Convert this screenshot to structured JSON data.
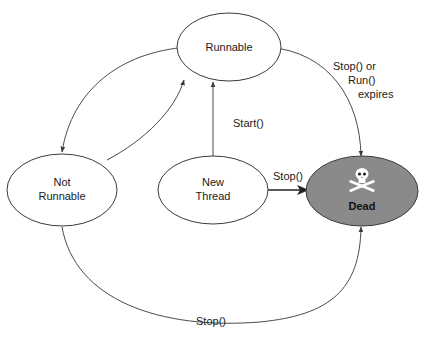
{
  "diagram": {
    "type": "state-diagram",
    "colors": {
      "background": "#ffffff",
      "node_fill": "#ffffff",
      "dead_fill": "#8a8a8a",
      "stroke": "#3a3a3a",
      "skull": "#ffffff"
    },
    "nodes": {
      "runnable": {
        "label": "Runnable"
      },
      "not_runnable": {
        "line1": "Not",
        "line2": "Runnable"
      },
      "new_thread": {
        "line1": "New",
        "line2": "Thread"
      },
      "dead": {
        "label": "Dead",
        "icon": "skull-crossbones-icon"
      }
    },
    "edges": {
      "runnable_to_not_runnable": {
        "label": ""
      },
      "not_runnable_to_runnable": {
        "label": ""
      },
      "new_thread_to_runnable": {
        "label": "Start()"
      },
      "new_thread_to_dead": {
        "label": "Stop()"
      },
      "runnable_to_dead": {
        "line1": "Stop() or",
        "line2": "Run()",
        "line3": "expires"
      },
      "not_runnable_to_dead": {
        "label": "Stop()"
      }
    }
  }
}
